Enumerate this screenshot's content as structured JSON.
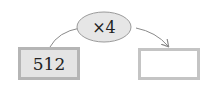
{
  "diagram": {
    "operation": {
      "label": "×4",
      "shape": "ellipse",
      "fill": "#e6e6e6",
      "stroke": "#9a9a9a"
    },
    "input_box": {
      "value": "512",
      "fill": "#e4e4e4",
      "border": "#b5b5b5"
    },
    "output_box": {
      "value": "",
      "fill": "#ffffff",
      "border": "#c4c4c4"
    },
    "arrows": [
      {
        "from": "input_box",
        "to": "operation"
      },
      {
        "from": "operation",
        "to": "output_box"
      }
    ]
  }
}
